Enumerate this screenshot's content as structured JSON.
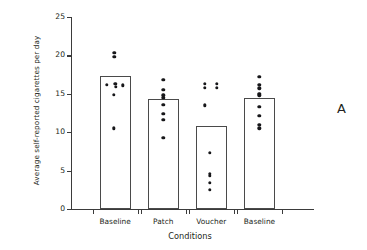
{
  "panel": {
    "label": "A"
  },
  "chart_data": {
    "type": "scatter",
    "title": "",
    "xlabel": "Conditions",
    "ylabel": "Average self-reported cigarettes per day",
    "categories": [
      "Baseline",
      "Patch",
      "Voucher",
      "Baseline"
    ],
    "values": [
      17.3,
      14.3,
      10.85,
      14.4
    ],
    "ylim": [
      0,
      25
    ],
    "yticks": [
      0,
      5,
      10,
      15,
      20,
      25
    ],
    "ytick_labels": [
      "0",
      "5",
      "10",
      "15",
      "20",
      "25"
    ],
    "grid": false,
    "legend": false,
    "bar_fill": "#ffffff",
    "bar_edge": "#4a4a4a",
    "dot_color": "#17171a",
    "overlay": "individual subject data points",
    "series": [
      {
        "name": "Baseline",
        "category_index": 0,
        "points": [
          {
            "value": 20.3,
            "offset": -0.02
          },
          {
            "value": 19.8,
            "offset": -0.02
          },
          {
            "value": 16.2,
            "offset": -0.26
          },
          {
            "value": 16.3,
            "offset": 0.0
          },
          {
            "value": 16.1,
            "offset": 0.25
          },
          {
            "value": 15.9,
            "offset": 0.02
          },
          {
            "value": 14.9,
            "offset": -0.04
          },
          {
            "value": 10.5,
            "offset": -0.05
          }
        ]
      },
      {
        "name": "Patch",
        "category_index": 1,
        "points": [
          {
            "value": 16.8,
            "offset": 0.0
          },
          {
            "value": 15.5,
            "offset": 0.0
          },
          {
            "value": 14.8,
            "offset": 0.0
          },
          {
            "value": 14.5,
            "offset": 0.0
          },
          {
            "value": 13.6,
            "offset": 0.0
          },
          {
            "value": 12.4,
            "offset": 0.0
          },
          {
            "value": 11.6,
            "offset": 0.0
          },
          {
            "value": 9.3,
            "offset": 0.0
          }
        ]
      },
      {
        "name": "Voucher",
        "category_index": 2,
        "points": [
          {
            "value": 16.3,
            "offset": -0.22
          },
          {
            "value": 15.8,
            "offset": -0.22
          },
          {
            "value": 16.3,
            "offset": 0.18
          },
          {
            "value": 15.8,
            "offset": 0.18
          },
          {
            "value": 13.5,
            "offset": -0.21
          },
          {
            "value": 7.3,
            "offset": -0.05
          },
          {
            "value": 4.6,
            "offset": -0.05
          },
          {
            "value": 4.3,
            "offset": -0.05
          },
          {
            "value": 3.4,
            "offset": -0.05
          },
          {
            "value": 2.5,
            "offset": -0.05
          }
        ]
      },
      {
        "name": "Baseline",
        "category_index": 3,
        "points": [
          {
            "value": 17.2,
            "offset": 0.0
          },
          {
            "value": 16.2,
            "offset": 0.0
          },
          {
            "value": 15.7,
            "offset": 0.0
          },
          {
            "value": 15.0,
            "offset": 0.0
          },
          {
            "value": 14.8,
            "offset": 0.0
          },
          {
            "value": 13.3,
            "offset": 0.0
          },
          {
            "value": 12.1,
            "offset": 0.0
          },
          {
            "value": 11.0,
            "offset": 0.0
          },
          {
            "value": 10.5,
            "offset": 0.0
          }
        ]
      }
    ]
  }
}
